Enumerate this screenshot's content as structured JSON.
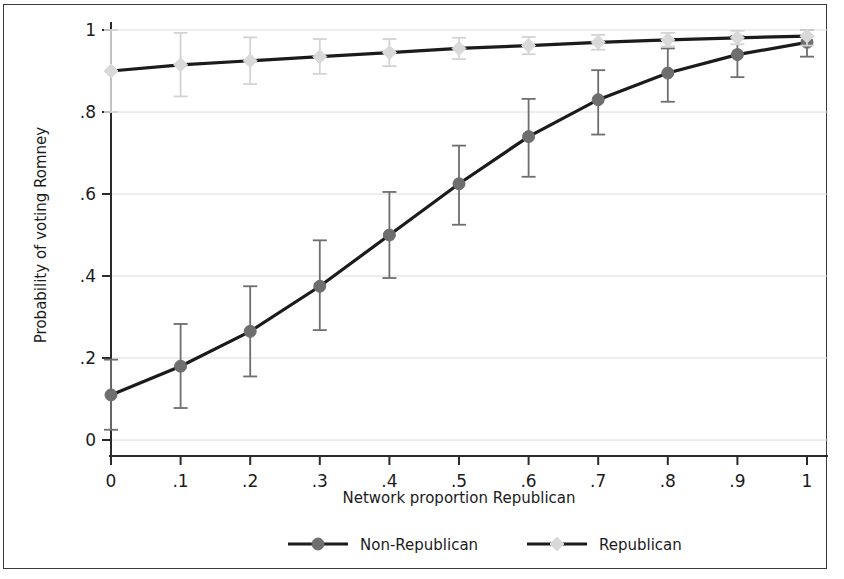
{
  "figure": {
    "background_color": "#ffffff",
    "border_color": "#3a3a3a"
  },
  "chart_data": {
    "type": "line",
    "title": "",
    "subtitle": "",
    "xlabel": "Network proportion Republican",
    "ylabel": "Probability of voting Romney",
    "xlim": [
      0,
      1
    ],
    "ylim": [
      0,
      1
    ],
    "grid": true,
    "grid_axis": "y",
    "legend_position": "bottom",
    "x_tick_labels": [
      "0",
      ".1",
      ".2",
      ".3",
      ".4",
      ".5",
      ".6",
      ".7",
      ".8",
      ".9",
      "1"
    ],
    "y_tick_labels": [
      "0",
      ".2",
      ".4",
      ".6",
      ".8",
      "1"
    ],
    "x_ticks": [
      0,
      0.1,
      0.2,
      0.3,
      0.4,
      0.5,
      0.6,
      0.7,
      0.8,
      0.9,
      1
    ],
    "y_ticks": [
      0,
      0.2,
      0.4,
      0.6,
      0.8,
      1
    ],
    "x": [
      0,
      0.1,
      0.2,
      0.3,
      0.4,
      0.5,
      0.6,
      0.7,
      0.8,
      0.9,
      1
    ],
    "series": [
      {
        "name": "Non-Republican",
        "marker": "circle",
        "color": "#6e6e6e",
        "line_color": "#1b1b1b",
        "errorbar_color": "#6e6e6e",
        "values": [
          0.11,
          0.18,
          0.265,
          0.375,
          0.5,
          0.625,
          0.74,
          0.83,
          0.895,
          0.94,
          0.97
        ],
        "ci_lower": [
          0.025,
          0.078,
          0.155,
          0.268,
          0.395,
          0.525,
          0.642,
          0.745,
          0.825,
          0.885,
          0.935
        ],
        "ci_upper": [
          0.196,
          0.283,
          0.375,
          0.487,
          0.605,
          0.718,
          0.832,
          0.902,
          0.955,
          0.985,
          1.0
        ]
      },
      {
        "name": "Republican",
        "marker": "diamond",
        "color": "#d9d9d9",
        "line_color": "#1b1b1b",
        "errorbar_color": "#d3d3d3",
        "values": [
          0.9,
          0.915,
          0.925,
          0.935,
          0.945,
          0.955,
          0.962,
          0.97,
          0.976,
          0.981,
          0.985
        ],
        "ci_lower": [
          0.8,
          0.838,
          0.868,
          0.893,
          0.912,
          0.929,
          0.941,
          0.952,
          0.96,
          0.965,
          0.962
        ],
        "ci_upper": [
          1.0,
          0.993,
          0.982,
          0.978,
          0.978,
          0.981,
          0.983,
          0.988,
          0.993,
          0.998,
          1.0
        ]
      }
    ]
  },
  "legend": {
    "items": [
      {
        "label": "Non-Republican",
        "marker": "circle",
        "marker_color": "#6e6e6e",
        "line_color": "#1b1b1b"
      },
      {
        "label": "Republican",
        "marker": "diamond",
        "marker_color": "#d9d9d9",
        "line_color": "#1b1b1b"
      }
    ]
  }
}
